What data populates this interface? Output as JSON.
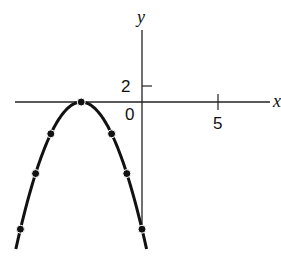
{
  "chart_data": {
    "type": "line",
    "title": "",
    "equation": "y = -(x + 4)^2",
    "xlabel": "x",
    "ylabel": "y",
    "x_ticks": [
      {
        "value": 5,
        "label": "5"
      }
    ],
    "y_ticks": [
      {
        "value": 2,
        "label": "2"
      }
    ],
    "origin_label": "0",
    "xlim": [
      -9.2,
      8.5
    ],
    "ylim": [
      -20,
      9
    ],
    "grid": false,
    "legend": null,
    "series": [
      {
        "name": "parabola",
        "points": [
          {
            "x": -8,
            "y": -16
          },
          {
            "x": -7,
            "y": -9
          },
          {
            "x": -6,
            "y": -4
          },
          {
            "x": -4,
            "y": 0
          },
          {
            "x": -2,
            "y": -4
          },
          {
            "x": -1,
            "y": -9
          },
          {
            "x": 0,
            "y": -16
          }
        ]
      }
    ]
  },
  "labels": {
    "x_axis": "x",
    "y_axis": "y",
    "tick_x5": "5",
    "tick_y2": "2",
    "origin": "0"
  }
}
